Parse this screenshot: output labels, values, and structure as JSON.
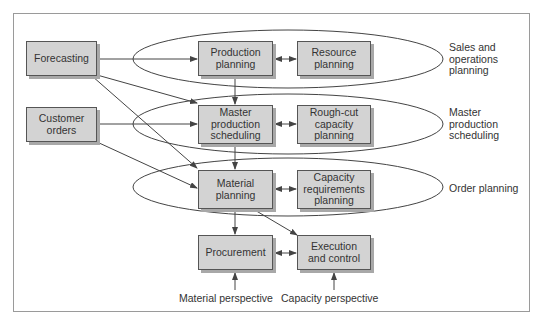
{
  "diagram": {
    "inputs": {
      "forecasting": "Forecasting",
      "customer_orders": "Customer\norders"
    },
    "material_column": {
      "production_planning": "Production\nplanning",
      "master_production_scheduling": "Master\nproduction\nscheduling",
      "material_planning": "Material\nplanning",
      "procurement": "Procurement"
    },
    "capacity_column": {
      "resource_planning": "Resource\nplanning",
      "rough_cut_capacity_planning": "Rough-cut\ncapacity\nplanning",
      "capacity_requirements_planning": "Capacity\nrequirements\nplanning",
      "execution_and_control": "Execution\nand control"
    },
    "levels": {
      "sales_and_operations_planning": "Sales and\noperations\nplanning",
      "master_production_scheduling": "Master\nproduction\nscheduling",
      "order_planning": "Order planning"
    },
    "perspectives": {
      "material": "Material perspective",
      "capacity": "Capacity perspective"
    },
    "colors": {
      "box_fill": "#d3d3d3",
      "box_border": "#555555",
      "box_shadow": "#a8a8a8",
      "line": "#444444",
      "frame": "#9a9a9a"
    }
  }
}
